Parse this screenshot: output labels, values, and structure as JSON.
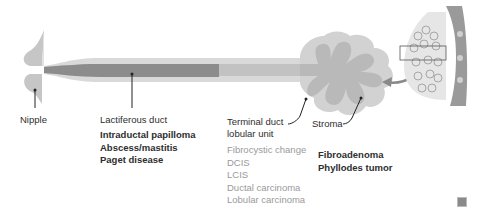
{
  "colors": {
    "duct_outer": "#d9d9d9",
    "duct_inner": "#bdbdbd",
    "duct_highlight": "#8c8c8c",
    "lobule_outer": "#d2d2d2",
    "lobule_inner": "#b9b9b9",
    "leader_line": "#222222",
    "arrow": "#8a8a8a",
    "text_dark": "#2e2e2e",
    "text_gray": "#9a9a9a"
  },
  "labels": {
    "nipple": "Nipple",
    "lactiferous_duct": "Lactiferous duct",
    "terminal_duct_line1": "Terminal duct",
    "terminal_duct_line2": "lobular unit",
    "stroma": "Stroma"
  },
  "conditions": {
    "lactiferous_duct": [
      "Intraductal papilloma",
      "Abscess/mastitis",
      "Paget disease"
    ],
    "terminal_duct_lobular_unit": [
      "Fibrocystic change",
      "DCIS",
      "LCIS",
      "Ductal carcinoma",
      "Lobular carcinoma"
    ],
    "stroma": [
      "Fibroadenoma",
      "Phyllodes tumor"
    ]
  },
  "watermark_icon": "fa-logo-icon"
}
